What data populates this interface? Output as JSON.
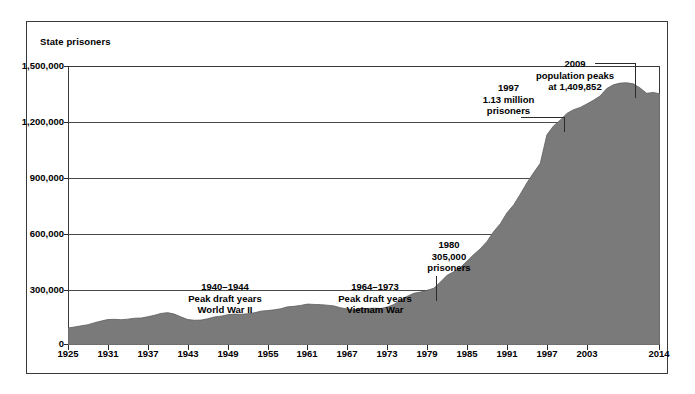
{
  "chart_data": {
    "type": "area",
    "title": "",
    "xlabel": "",
    "ylabel": "State prisoners",
    "ylim": [
      0,
      1500000
    ],
    "xlim": [
      1925,
      2014
    ],
    "grid": true,
    "legend": "none",
    "fill_color": "#7a7a7a",
    "y_ticks": [
      "0",
      "300,000",
      "600,000",
      "900,000",
      "1,200,000",
      "1,500,000"
    ],
    "y_tick_values": [
      0,
      300000,
      600000,
      900000,
      1200000,
      1500000
    ],
    "x_ticks": [
      "1925",
      "1931",
      "1937",
      "1943",
      "1949",
      "1955",
      "1961",
      "1967",
      "1973",
      "1979",
      "1985",
      "1991",
      "1997",
      "2003",
      "2014"
    ],
    "x_tick_values": [
      1925,
      1931,
      1937,
      1943,
      1949,
      1955,
      1961,
      1967,
      1973,
      1979,
      1985,
      1991,
      1997,
      2003,
      2014
    ],
    "x": [
      1925,
      1926,
      1927,
      1928,
      1929,
      1930,
      1931,
      1932,
      1933,
      1934,
      1935,
      1936,
      1937,
      1938,
      1939,
      1940,
      1941,
      1942,
      1943,
      1944,
      1945,
      1946,
      1947,
      1948,
      1949,
      1950,
      1951,
      1952,
      1953,
      1954,
      1955,
      1956,
      1957,
      1958,
      1959,
      1960,
      1961,
      1962,
      1963,
      1964,
      1965,
      1966,
      1967,
      1968,
      1969,
      1970,
      1971,
      1972,
      1973,
      1974,
      1975,
      1976,
      1977,
      1978,
      1979,
      1980,
      1981,
      1982,
      1983,
      1984,
      1985,
      1986,
      1987,
      1988,
      1989,
      1990,
      1991,
      1992,
      1993,
      1994,
      1995,
      1996,
      1997,
      1998,
      1999,
      2000,
      2001,
      2002,
      2003,
      2004,
      2005,
      2006,
      2007,
      2008,
      2009,
      2010,
      2011,
      2012,
      2013,
      2014
    ],
    "values": [
      91669,
      97000,
      103000,
      109000,
      120000,
      129000,
      137000,
      138000,
      136000,
      139000,
      144000,
      145000,
      152000,
      160000,
      170000,
      174000,
      166000,
      151000,
      137000,
      133000,
      134000,
      141000,
      151000,
      155000,
      163000,
      166000,
      165000,
      168000,
      173000,
      182000,
      185000,
      189000,
      195000,
      205000,
      208000,
      213000,
      220000,
      218000,
      217000,
      214000,
      210000,
      200000,
      194000,
      188000,
      197000,
      196000,
      198000,
      196000,
      204000,
      218000,
      241000,
      262000,
      278000,
      285000,
      294000,
      305000,
      339000,
      375000,
      394000,
      417000,
      451000,
      486000,
      518000,
      557000,
      610000,
      652000,
      711000,
      753000,
      811000,
      872000,
      926000,
      977000,
      1130000,
      1178000,
      1209000,
      1245000,
      1265000,
      1277000,
      1296000,
      1316000,
      1339000,
      1379000,
      1399000,
      1408000,
      1409852,
      1404000,
      1382000,
      1353000,
      1358000,
      1350000
    ],
    "annotations": [
      {
        "id": "wwii",
        "lines": [
          "1940–1944",
          "Peak draft years",
          "World War II"
        ]
      },
      {
        "id": "vietnam",
        "lines": [
          "1964–1973",
          "Peak draft years",
          "Vietnam War"
        ]
      },
      {
        "id": "y1980",
        "lines": [
          "1980",
          "305,000",
          "prisoners"
        ]
      },
      {
        "id": "y1997",
        "lines": [
          "1997",
          "1.13 million",
          "prisoners"
        ]
      },
      {
        "id": "y2009",
        "lines": [
          "2009",
          "population peaks",
          "at 1,409,852"
        ]
      }
    ]
  },
  "axis": {
    "y_title": "State prisoners",
    "y_ticks": {
      "t1500000": "1,500,000",
      "t1200000": "1,200,000",
      "t900000": "900,000",
      "t600000": "600,000",
      "t300000": "300,000",
      "t0": "0"
    },
    "x_ticks": {
      "t1925": "1925",
      "t1931": "1931",
      "t1937": "1937",
      "t1943": "1943",
      "t1949": "1949",
      "t1955": "1955",
      "t1961": "1961",
      "t1967": "1967",
      "t1973": "1973",
      "t1979": "1979",
      "t1985": "1985",
      "t1991": "1991",
      "t1997": "1997",
      "t2003": "2003",
      "t2014": "2014"
    }
  },
  "annotations": {
    "wwii": {
      "line1": "1940–1944",
      "line2": "Peak draft years",
      "line3": "World War II"
    },
    "vietnam": {
      "line1": "1964–1973",
      "line2": "Peak draft years",
      "line3": "Vietnam War"
    },
    "y1980": {
      "line1": "1980",
      "line2": "305,000",
      "line3": "prisoners"
    },
    "y1997": {
      "line1": "1997",
      "line2": "1.13 million",
      "line3": "prisoners"
    },
    "y2009": {
      "line1": "2009",
      "line2": "population peaks",
      "line3": "at 1,409,852"
    }
  }
}
